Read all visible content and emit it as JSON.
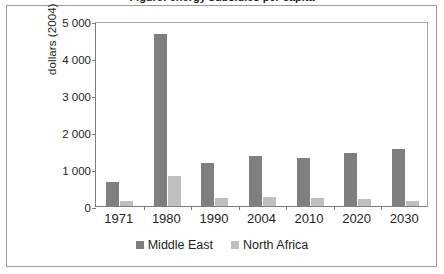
{
  "figure": {
    "title_clipped": "Figure: energy subsidies per capita",
    "background": "#ffffff",
    "frame_color": "#9b9b9b"
  },
  "chart_data": {
    "type": "bar",
    "title": "",
    "xlabel": "",
    "ylabel": "dollars (2004) per capita",
    "categories": [
      "1971",
      "1980",
      "1990",
      "2004",
      "2010",
      "2020",
      "2030"
    ],
    "series": [
      {
        "name": "Middle East",
        "color": "#7f7f7f",
        "values": [
          650,
          4650,
          1150,
          1350,
          1300,
          1420,
          1550
        ]
      },
      {
        "name": "North Africa",
        "color": "#bfbfbf",
        "values": [
          130,
          810,
          220,
          240,
          225,
          180,
          135
        ]
      }
    ],
    "ylim": [
      0,
      5000
    ],
    "yticks": [
      0,
      1000,
      2000,
      3000,
      4000,
      5000
    ],
    "ytick_labels": [
      "0",
      "1 000",
      "2 000",
      "3 000",
      "4 000",
      "5 000"
    ],
    "grid": false,
    "legend_position": "bottom"
  },
  "legend": {
    "items": [
      {
        "label": "Middle East",
        "swatch": "me"
      },
      {
        "label": "North Africa",
        "swatch": "na"
      }
    ]
  }
}
